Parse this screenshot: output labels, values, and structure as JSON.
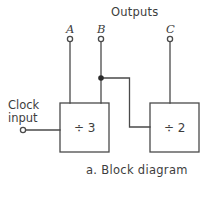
{
  "figure": {
    "caption": "a.  Block diagram",
    "outputs_header": "Outputs",
    "clock_input_label_line1": "Clock",
    "clock_input_label_line2": "input",
    "pins": [
      {
        "name": "output-pin-a",
        "label": "A",
        "cx": 70,
        "cy": 39
      },
      {
        "name": "output-pin-b",
        "label": "B",
        "cx": 101,
        "cy": 39
      },
      {
        "name": "output-pin-c",
        "label": "C",
        "cx": 170,
        "cy": 39
      }
    ],
    "blocks": [
      {
        "name": "divide-by-3-block",
        "label": "÷ 3",
        "x": 60,
        "y": 103,
        "w": 49,
        "h": 49
      },
      {
        "name": "divide-by-2-block",
        "label": "÷ 2",
        "x": 150,
        "y": 103,
        "w": 49,
        "h": 49
      }
    ],
    "clock_terminal": {
      "cx": 23,
      "cy": 130
    },
    "junction_dot": {
      "cx": 101,
      "cy": 78
    },
    "colors": {
      "background": "#ffffff",
      "ink": "#3d3d3d",
      "wire": "#4a4a4a"
    },
    "stroke_width": 1.3
  }
}
